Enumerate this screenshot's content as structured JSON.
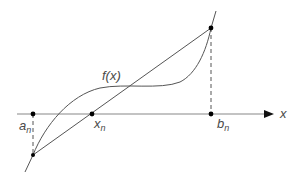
{
  "diagram": {
    "curve_label": "f(x)",
    "axis_label": "x",
    "points": {
      "a": {
        "base": "a",
        "sub": "n"
      },
      "b": {
        "base": "b",
        "sub": "n"
      },
      "x": {
        "base": "x",
        "sub": "n"
      }
    },
    "colors": {
      "line": "#555555",
      "axis": "#777777",
      "text": "#4a4a4a",
      "point": "#000000"
    }
  }
}
